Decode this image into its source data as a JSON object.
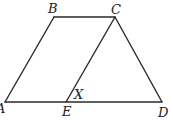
{
  "diagram": {
    "type": "geometry-figure",
    "stroke_color": "#2a2a2a",
    "background": "#ffffff",
    "points": {
      "A": {
        "label": "A",
        "x": 5,
        "y": 102,
        "label_x": -4,
        "label_y": 113
      },
      "B": {
        "label": "B",
        "x": 54,
        "y": 17,
        "label_x": 48,
        "label_y": 13
      },
      "C": {
        "label": "C",
        "x": 115,
        "y": 17,
        "label_x": 111,
        "label_y": 14
      },
      "D": {
        "label": "D",
        "x": 162,
        "y": 102,
        "label_x": 158,
        "label_y": 117
      },
      "E": {
        "label": "E",
        "x": 66,
        "y": 102,
        "label_x": 62,
        "label_y": 116
      }
    },
    "segments": [
      {
        "from": "A",
        "to": "B"
      },
      {
        "from": "B",
        "to": "C"
      },
      {
        "from": "C",
        "to": "D"
      },
      {
        "from": "A",
        "to": "D"
      },
      {
        "from": "C",
        "to": "E"
      }
    ],
    "angle_labels": [
      {
        "label": "X",
        "at": "E",
        "x": 74,
        "y": 99
      }
    ]
  }
}
